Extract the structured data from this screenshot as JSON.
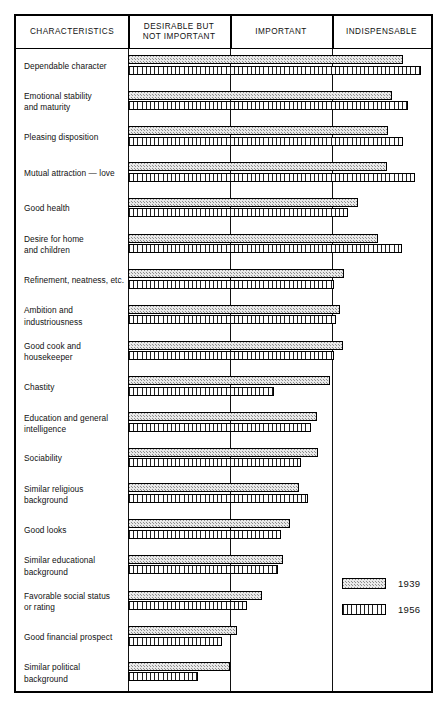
{
  "chart_data": {
    "type": "bar",
    "orientation": "horizontal",
    "title": "",
    "xlabel": "",
    "ylabel": "CHARACTERISTICS",
    "grid": true,
    "legend_position": "bottom-right",
    "axis_category_labels": [
      "DESIRABLE BUT NOT IMPORTANT",
      "IMPORTANT",
      "INDISPENSABLE"
    ],
    "xlim": [
      0,
      3
    ],
    "value_scale_note": "Bar length measured in rating-category units: 1 = end of 'Desirable but not important', 2 = end of 'Important', 3 = end of 'Indispensable'",
    "categories": [
      "Dependable character",
      "Emotional stability and maturity",
      "Pleasing disposition",
      "Mutual attraction — love",
      "Good health",
      "Desire for home and children",
      "Refinement, neatness, etc.",
      "Ambition and industriousness",
      "Good cook and housekeeper",
      "Chastity",
      "Education and general intelligence",
      "Sociability",
      "Similar religious background",
      "Good looks",
      "Similar educational background",
      "Favorable social status or rating",
      "Good financial prospect",
      "Similar political background"
    ],
    "series": [
      {
        "name": "1939",
        "pattern": "stipple",
        "values": [
          2.71,
          2.6,
          2.56,
          2.55,
          2.27,
          2.46,
          2.13,
          2.09,
          2.12,
          1.99,
          1.86,
          1.87,
          1.68,
          1.6,
          1.53,
          1.32,
          1.07,
          1.0
        ]
      },
      {
        "name": "1956",
        "pattern": "vertical-stripes",
        "values": [
          2.89,
          2.76,
          2.71,
          2.83,
          2.17,
          2.7,
          2.03,
          2.05,
          2.03,
          1.44,
          1.8,
          1.7,
          1.77,
          1.51,
          1.48,
          1.17,
          0.93,
          0.69
        ]
      }
    ]
  },
  "header": {
    "col_characteristics": "CHARACTERISTICS",
    "col_desirable_line1": "DESIRABLE  BUT",
    "col_desirable_line2": "NOT  IMPORTANT",
    "col_important": "IMPORTANT",
    "col_indispensable": "INDISPENSABLE"
  },
  "legend": {
    "items": [
      {
        "label": "1939",
        "pattern": "stipple"
      },
      {
        "label": "1956",
        "pattern": "vertical-stripes"
      }
    ]
  },
  "rows": [
    {
      "label_line1": "Dependable character",
      "label_line2": ""
    },
    {
      "label_line1": "Emotional stability",
      "label_line2": "and maturity"
    },
    {
      "label_line1": "Pleasing disposition",
      "label_line2": ""
    },
    {
      "label_line1": "Mutual attraction — love",
      "label_line2": ""
    },
    {
      "label_line1": "Good health",
      "label_line2": ""
    },
    {
      "label_line1": "Desire for home",
      "label_line2": "and children"
    },
    {
      "label_line1": "Refinement, neatness, etc.",
      "label_line2": ""
    },
    {
      "label_line1": "Ambition and",
      "label_line2": "industriousness"
    },
    {
      "label_line1": "Good cook and",
      "label_line2": "housekeeper"
    },
    {
      "label_line1": "Chastity",
      "label_line2": ""
    },
    {
      "label_line1": "Education and general",
      "label_line2": "intelligence"
    },
    {
      "label_line1": "Sociability",
      "label_line2": ""
    },
    {
      "label_line1": "Similar religious",
      "label_line2": "background"
    },
    {
      "label_line1": "Good looks",
      "label_line2": ""
    },
    {
      "label_line1": "Similar educational",
      "label_line2": "background"
    },
    {
      "label_line1": "Favorable social status",
      "label_line2": "or rating"
    },
    {
      "label_line1": "Good financial prospect",
      "label_line2": ""
    },
    {
      "label_line1": "Similar political",
      "label_line2": "background"
    }
  ]
}
